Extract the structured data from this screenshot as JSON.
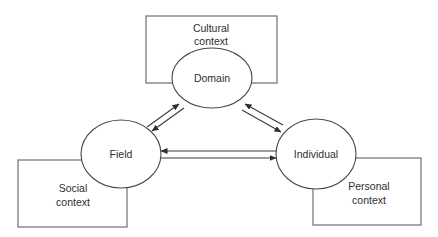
{
  "diagram": {
    "type": "systems-model",
    "contexts": [
      {
        "id": "cultural",
        "lines": [
          "Cultural",
          "context"
        ]
      },
      {
        "id": "social",
        "lines": [
          "Social",
          "context"
        ]
      },
      {
        "id": "personal",
        "lines": [
          "Personal",
          "context"
        ]
      }
    ],
    "nodes": [
      {
        "id": "domain",
        "label": "Domain"
      },
      {
        "id": "field",
        "label": "Field"
      },
      {
        "id": "individual",
        "label": "Individual"
      }
    ],
    "edges": [
      {
        "from": "field",
        "to": "domain"
      },
      {
        "from": "domain",
        "to": "field"
      },
      {
        "from": "individual",
        "to": "domain"
      },
      {
        "from": "domain",
        "to": "individual"
      },
      {
        "from": "individual",
        "to": "field"
      },
      {
        "from": "field",
        "to": "individual"
      }
    ]
  }
}
